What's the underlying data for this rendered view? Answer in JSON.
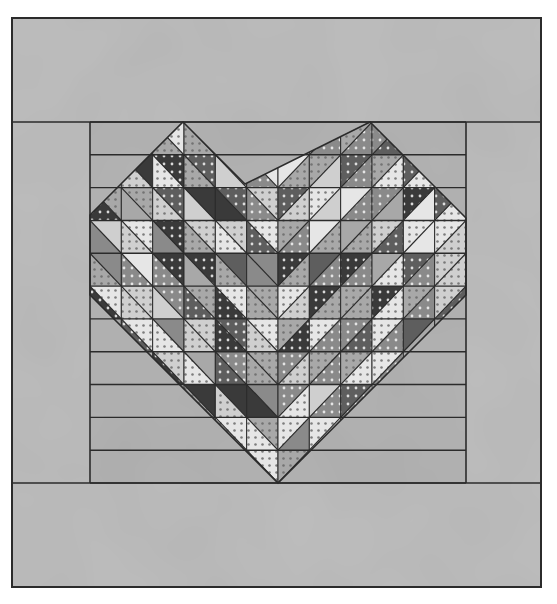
{
  "illustration": {
    "subject": "heart-quilt",
    "colors": {
      "background": "#ffffff",
      "border_fabric": "#bdbdbd",
      "panel_fabric": "#b3b3b3",
      "line": "#2b2b2b",
      "shades": [
        "#e6e6e6",
        "#cfcfcf",
        "#a8a8a8",
        "#8a8a8a",
        "#5e5e5e",
        "#3a3a3a"
      ]
    },
    "frame": {
      "x": 12,
      "y": 18,
      "w": 529,
      "h": 569
    },
    "top_border": {
      "y": 18,
      "h": 104
    },
    "bottom_border": {
      "y": 483,
      "h": 104
    },
    "left_border": {
      "x": 12,
      "w": 78
    },
    "right_border": {
      "x": 466,
      "w": 75
    },
    "panel": {
      "x": 90,
      "y": 122,
      "w": 376,
      "h": 361,
      "cols": 12,
      "rows": 11
    },
    "heart_point": {
      "x": 278,
      "y": 483
    },
    "lobe_apexes": [
      {
        "x": 183,
        "y": 122
      },
      {
        "x": 370,
        "y": 122
      }
    ]
  }
}
